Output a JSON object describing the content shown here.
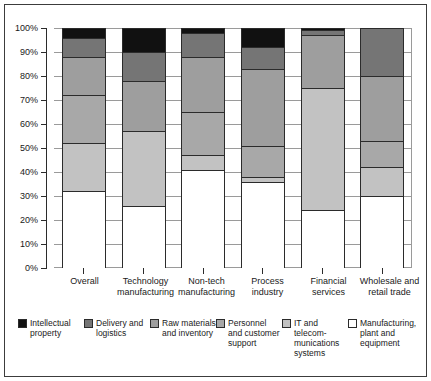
{
  "chart_data": {
    "type": "bar",
    "subtype": "stacked-percentage-column",
    "title": "",
    "xlabel": "",
    "ylabel": "",
    "ylim": [
      0,
      100
    ],
    "yticks": [
      "0%",
      "10%",
      "20%",
      "30%",
      "40%",
      "50%",
      "60%",
      "70%",
      "80%",
      "90%",
      "100%"
    ],
    "grid": true,
    "legend_position": "bottom",
    "categories": [
      "Overall",
      "Technology manufacturing",
      "Non-tech manufacturing",
      "Process industry",
      "Financial services",
      "Wholesale and retail trade"
    ],
    "series": [
      {
        "name": "Intellectual property",
        "color": "#111111",
        "values": [
          4,
          10,
          2,
          8,
          1,
          0
        ]
      },
      {
        "name": "Delivery and logistics",
        "color": "#757575",
        "values": [
          8,
          12,
          10,
          9,
          2,
          20
        ]
      },
      {
        "name": "Raw materials and inventory",
        "color": "#9e9e9e",
        "values": [
          16,
          21,
          23,
          32,
          22,
          27
        ]
      },
      {
        "name": "Personnel and customer support",
        "color": "#a8a8a8",
        "values": [
          20,
          0,
          18,
          13,
          0,
          11
        ]
      },
      {
        "name": "IT and telecommunications systems",
        "color": "#c2c2c2",
        "values": [
          20,
          31,
          6,
          2,
          51,
          12
        ]
      },
      {
        "name": "Manufacturing, plant and equipment",
        "color": "#ffffff",
        "values": [
          32,
          26,
          41,
          36,
          24,
          30
        ]
      }
    ]
  },
  "legend": {
    "items": [
      {
        "label_line1": "Intellectual",
        "label_line2": "property",
        "label_line3": ""
      },
      {
        "label_line1": "Delivery and",
        "label_line2": "logistics",
        "label_line3": ""
      },
      {
        "label_line1": "Raw materials",
        "label_line2": "and inventory",
        "label_line3": ""
      },
      {
        "label_line1": "Personnel",
        "label_line2": "and customer",
        "label_line3": "support"
      },
      {
        "label_line1": "IT and telecom-",
        "label_line2": "munications",
        "label_line3": "systems"
      },
      {
        "label_line1": "Manufacturing,",
        "label_line2": "plant and",
        "label_line3": "equipment"
      }
    ]
  },
  "xaxis": {
    "labels": [
      {
        "line1": "Overall",
        "line2": ""
      },
      {
        "line1": "Technology",
        "line2": "manufacturing"
      },
      {
        "line1": "Non-tech",
        "line2": "manufacturing"
      },
      {
        "line1": "Process",
        "line2": "industry"
      },
      {
        "line1": "Financial",
        "line2": "services"
      },
      {
        "line1": "Wholesale and",
        "line2": "retail trade"
      }
    ]
  }
}
